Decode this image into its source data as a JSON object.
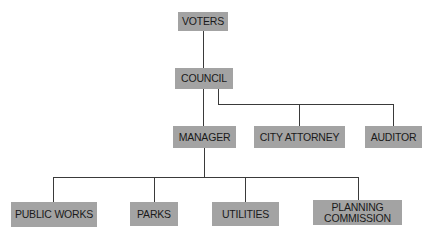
{
  "diagram": {
    "type": "org-chart",
    "nodes": {
      "voters": "VOTERS",
      "council": "COUNCIL",
      "manager": "MANAGER",
      "city_attorney": "CITY ATTORNEY",
      "auditor": "AUDITOR",
      "public_works": "PUBLIC WORKS",
      "parks": "PARKS",
      "utilities": "UTILITIES",
      "planning_commission": "PLANNING COMMISSION"
    },
    "edges": [
      [
        "VOTERS",
        "COUNCIL"
      ],
      [
        "COUNCIL",
        "MANAGER"
      ],
      [
        "COUNCIL",
        "CITY ATTORNEY"
      ],
      [
        "COUNCIL",
        "AUDITOR"
      ],
      [
        "MANAGER",
        "PUBLIC WORKS"
      ],
      [
        "MANAGER",
        "PARKS"
      ],
      [
        "MANAGER",
        "UTILITIES"
      ],
      [
        "MANAGER",
        "PLANNING COMMISSION"
      ]
    ],
    "colors": {
      "box": "#a3a3a3",
      "line": "#3a3a3a",
      "text": "#1a1a1a"
    }
  }
}
